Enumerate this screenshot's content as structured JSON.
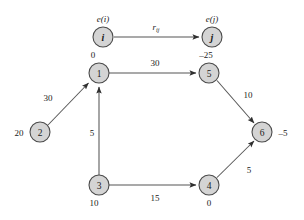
{
  "figure": {
    "type": "directed-graph",
    "background_color": "#ffffff",
    "node_fill_color": "#d4d4d4",
    "node_stroke_color": "#4a4a4a",
    "edge_color": "#555555"
  },
  "legend": {
    "source_node_label": "i",
    "target_node_label": "j",
    "source_excess_label": "e(i)",
    "target_excess_label": "e(j)",
    "edge_capacity_label": "r",
    "edge_capacity_subscript": "ij"
  },
  "graph_data": {
    "nodes": [
      {
        "id": "1",
        "label": "1",
        "excess": "0",
        "excess_position": "above"
      },
      {
        "id": "2",
        "label": "2",
        "excess": "20",
        "excess_position": "left"
      },
      {
        "id": "3",
        "label": "3",
        "excess": "10",
        "excess_position": "below"
      },
      {
        "id": "4",
        "label": "4",
        "excess": "0",
        "excess_position": "below"
      },
      {
        "id": "5",
        "label": "5",
        "excess": "–25",
        "excess_position": "above"
      },
      {
        "id": "6",
        "label": "6",
        "excess": "–5",
        "excess_position": "right"
      }
    ],
    "edges": [
      {
        "from": "2",
        "to": "1",
        "weight": "30"
      },
      {
        "from": "3",
        "to": "1",
        "weight": "5"
      },
      {
        "from": "1",
        "to": "5",
        "weight": "30"
      },
      {
        "from": "5",
        "to": "6",
        "weight": "10"
      },
      {
        "from": "3",
        "to": "4",
        "weight": "15"
      },
      {
        "from": "4",
        "to": "6",
        "weight": "5"
      }
    ]
  }
}
